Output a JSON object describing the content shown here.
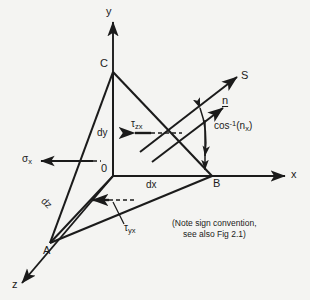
{
  "figure": {
    "type": "stress-tetrahedron-diagram",
    "background_color": "#f4f4f2",
    "ink_color": "#1b1b1b"
  },
  "axes": {
    "x_label": "x",
    "y_label": "y",
    "z_label": "z"
  },
  "vertices": {
    "origin_label": "0",
    "a_label": "A",
    "b_label": "B",
    "c_label": "C"
  },
  "dimensions": {
    "dx_label": "dx",
    "dy_label": "dy",
    "dz_label": "dz"
  },
  "vectors": {
    "traction_label": "S",
    "normal_label": "n",
    "angle_label_cos": "cos",
    "angle_label_exp": "-1",
    "angle_label_arg": "(n",
    "angle_label_sub": "x",
    "angle_label_close": ")"
  },
  "stresses": {
    "sigma_x_glyph": "σ",
    "sigma_x_sub": "x",
    "tau_zx_glyph": "τ",
    "tau_zx_sub": "zx",
    "tau_yx_glyph": "τ",
    "tau_yx_sub": "yx"
  },
  "note": {
    "line1": "(Note sign convention,",
    "line2": "see also Fig 2.1)"
  }
}
